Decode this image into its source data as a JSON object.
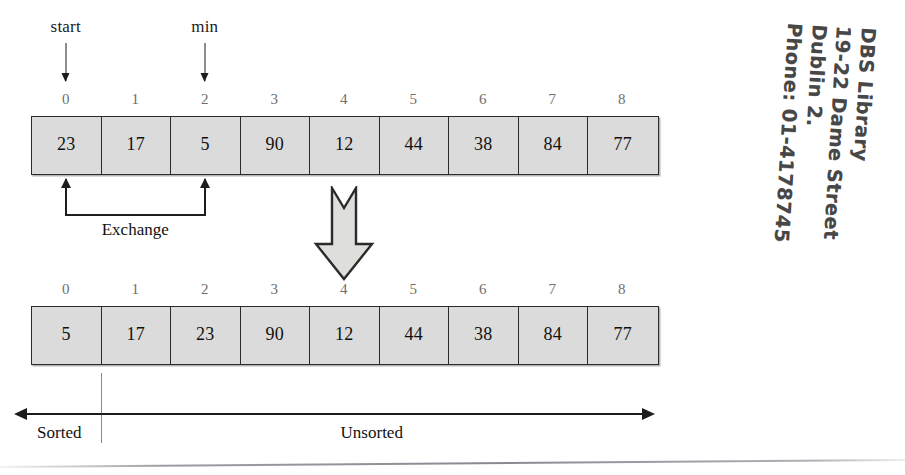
{
  "figure": {
    "pointers": [
      {
        "name": "start-pointer",
        "label": "start",
        "index": 0
      },
      {
        "name": "min-pointer",
        "label": "min",
        "index": 2
      }
    ],
    "exchange_label": "Exchange",
    "transition_icon": "down-block-arrow-icon",
    "indices": [
      "0",
      "1",
      "2",
      "3",
      "4",
      "5",
      "6",
      "7",
      "8"
    ],
    "array_before": {
      "name": "array-before-exchange",
      "values": [
        "23",
        "17",
        "5",
        "90",
        "12",
        "44",
        "38",
        "84",
        "77"
      ]
    },
    "array_after": {
      "name": "array-after-exchange",
      "values": [
        "5",
        "17",
        "23",
        "90",
        "12",
        "44",
        "38",
        "84",
        "77"
      ]
    },
    "partition": {
      "sorted_label": "Sorted",
      "unsorted_label": "Unsorted",
      "boundary_index": 1
    }
  },
  "colors": {
    "cell_fill": "#dbdbdb",
    "cell_border": "#2b2b2b",
    "index_text": "#6e6e6e",
    "ink": "#1d1d1d",
    "stamp_ink": "#2e2e2e",
    "page_rule": "#8c8c94",
    "background": "#ffffff"
  },
  "stamp": {
    "name": "library-ownership-stamp",
    "lines": [
      "DBS Library",
      "19-22 Dame Street",
      "Dublin 2.",
      "Phone: 01-4178745"
    ]
  }
}
